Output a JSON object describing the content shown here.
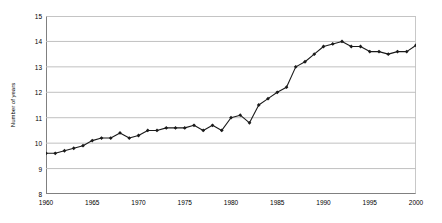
{
  "chart_data": {
    "type": "line",
    "title": "",
    "subtitle": "",
    "xlabel": "",
    "ylabel": "Number of years",
    "xlim": [
      1960,
      2000
    ],
    "ylim": [
      8,
      15
    ],
    "grid": true,
    "grid_axis": "y",
    "legend": false,
    "legend_position": "none",
    "marker": "diamond",
    "line_color": "#1a1a1a",
    "marker_color": "#1a1a1a",
    "gridline_color": "#c0c0c0",
    "axis_color": "#808080",
    "background_color": "#ffffff",
    "y_ticks": [
      8,
      9,
      10,
      11,
      12,
      13,
      14,
      15
    ],
    "y_tick_labels": [
      "8",
      "9",
      "10",
      "11",
      "12",
      "13",
      "14",
      "15"
    ],
    "x_ticks": [
      1960,
      1965,
      1970,
      1975,
      1980,
      1985,
      1990,
      1995,
      2000
    ],
    "x_tick_labels": [
      "1960",
      "1965",
      "1970",
      "1975",
      "1980",
      "1985",
      "1990",
      "1995",
      "2000"
    ],
    "x_minor_tick_step": 1,
    "x": [
      1960,
      1961,
      1962,
      1963,
      1964,
      1965,
      1966,
      1967,
      1968,
      1969,
      1970,
      1971,
      1972,
      1973,
      1974,
      1975,
      1976,
      1977,
      1978,
      1979,
      1980,
      1981,
      1982,
      1983,
      1984,
      1985,
      1986,
      1987,
      1988,
      1989,
      1990,
      1991,
      1992,
      1993,
      1994,
      1995,
      1996,
      1997,
      1998,
      1999,
      2000
    ],
    "series": [
      {
        "name": "Number of years",
        "values": [
          9.6,
          9.6,
          9.7,
          9.8,
          9.9,
          10.1,
          10.2,
          10.2,
          10.4,
          10.2,
          10.3,
          10.5,
          10.5,
          10.6,
          10.6,
          10.6,
          10.7,
          10.5,
          10.7,
          10.5,
          11.0,
          11.1,
          10.8,
          11.5,
          11.75,
          12.0,
          12.2,
          13.0,
          13.2,
          13.5,
          13.8,
          13.9,
          14.0,
          13.8,
          13.8,
          13.6,
          13.6,
          13.5,
          13.6,
          13.6,
          13.85
        ]
      }
    ]
  }
}
